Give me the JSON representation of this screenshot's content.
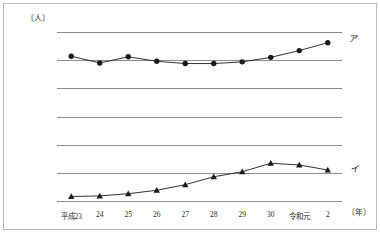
{
  "chart_data": {
    "type": "line",
    "title": "",
    "xlabel": "〔年〕",
    "ylabel": "〔人〕",
    "ylim": [
      0,
      30000
    ],
    "ytick_step": 5000,
    "grid": true,
    "legend_position": "inline-right",
    "categories": [
      "平成23",
      "24",
      "25",
      "26",
      "27",
      "28",
      "29",
      "30",
      "令和元",
      "2"
    ],
    "yticks": [
      "0",
      "5000",
      "10000",
      "15000",
      "20000",
      "25000",
      "30000"
    ],
    "ytick_values": [
      0,
      5000,
      10000,
      15000,
      20000,
      25000,
      30000
    ],
    "series": [
      {
        "name": "ア",
        "marker": "circle",
        "label": "ア",
        "color": "#1a1a1a",
        "values": [
          25700,
          24500,
          25600,
          24800,
          24400,
          24400,
          24700,
          25500,
          26700,
          28100
        ]
      },
      {
        "name": "イ",
        "marker": "triangle",
        "label": "イ",
        "color": "#1a1a1a",
        "values": [
          800,
          900,
          1300,
          1900,
          2900,
          4300,
          5200,
          6700,
          6400,
          5500
        ]
      }
    ],
    "colors": {
      "line": "#1a1a1a",
      "grid": "#8d8d8d",
      "frame": "#b9b9b9",
      "text": "#2a2a2a"
    }
  }
}
